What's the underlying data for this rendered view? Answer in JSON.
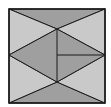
{
  "diagram": {
    "type": "geometric-tiling",
    "colors": {
      "background": "#ffffff",
      "light": "#c9c9c9",
      "dark": "#9f9f9f",
      "stroke": "#1a1a1a"
    },
    "square": {
      "x1": 9,
      "y1": 9,
      "x2": 105,
      "y2": 103
    },
    "points": {
      "tl": [
        9,
        9
      ],
      "tr": [
        105,
        9
      ],
      "bl": [
        9,
        103
      ],
      "br": [
        105,
        103
      ],
      "top_apex": [
        57,
        29
      ],
      "bottom_apex": [
        57,
        82
      ],
      "left_mid": [
        9,
        55
      ],
      "right_mid": [
        105,
        55
      ],
      "center": [
        57,
        55
      ]
    },
    "regions": [
      {
        "name": "top-triangle",
        "shade": "dark"
      },
      {
        "name": "bottom-triangle",
        "shade": "dark"
      },
      {
        "name": "left-upper-triangle",
        "shade": "light"
      },
      {
        "name": "left-lower-triangle",
        "shade": "light"
      },
      {
        "name": "right-upper-triangle",
        "shade": "light"
      },
      {
        "name": "right-lower-triangle",
        "shade": "light"
      },
      {
        "name": "central-kite",
        "shade": "dark"
      }
    ]
  }
}
